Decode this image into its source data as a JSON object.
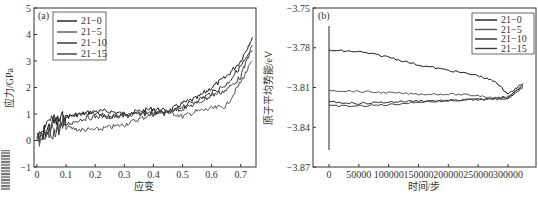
{
  "chart_data": [
    {
      "panel": "(a)",
      "type": "line",
      "title": "",
      "xlabel": "应变",
      "ylabel": "应力/GPa",
      "xlim": [
        -0.01,
        0.75
      ],
      "ylim": [
        -1,
        5
      ],
      "xticks": [
        "0",
        "0.1",
        "0.2",
        "0.3",
        "0.4",
        "0.5",
        "0.6",
        "0.7"
      ],
      "yticks": [
        "-1",
        "0",
        "1",
        "2",
        "3",
        "4",
        "5"
      ],
      "grid": false,
      "legend_position": "upper left",
      "series": [
        {
          "name": "21-0",
          "x": [
            0,
            0.05,
            0.1,
            0.15,
            0.2,
            0.25,
            0.3,
            0.35,
            0.4,
            0.45,
            0.5,
            0.55,
            0.6,
            0.65,
            0.7,
            0.74
          ],
          "y": [
            0.0,
            0.6,
            0.9,
            1.0,
            1.1,
            1.1,
            1.0,
            1.1,
            1.2,
            1.1,
            1.4,
            1.6,
            2.0,
            2.4,
            3.0,
            3.9
          ]
        },
        {
          "name": "21-5",
          "x": [
            0,
            0.05,
            0.1,
            0.15,
            0.2,
            0.25,
            0.3,
            0.35,
            0.4,
            0.45,
            0.5,
            0.55,
            0.6,
            0.65,
            0.7,
            0.74
          ],
          "y": [
            0.0,
            0.4,
            0.5,
            0.4,
            0.4,
            0.5,
            0.6,
            0.8,
            1.0,
            1.1,
            0.9,
            1.1,
            1.2,
            1.3,
            2.2,
            3.0
          ]
        },
        {
          "name": "21-10",
          "x": [
            0,
            0.05,
            0.1,
            0.15,
            0.2,
            0.25,
            0.3,
            0.35,
            0.4,
            0.45,
            0.5,
            0.55,
            0.6,
            0.65,
            0.7,
            0.74
          ],
          "y": [
            0.0,
            0.7,
            0.9,
            1.0,
            1.0,
            0.9,
            1.0,
            1.0,
            1.1,
            1.0,
            1.3,
            1.5,
            1.8,
            2.1,
            2.8,
            3.4
          ]
        },
        {
          "name": "21-15",
          "x": [
            0,
            0.05,
            0.1,
            0.15,
            0.2,
            0.25,
            0.3,
            0.35,
            0.4,
            0.45,
            0.5,
            0.55,
            0.6,
            0.65,
            0.7,
            0.74
          ],
          "y": [
            0.0,
            0.3,
            0.6,
            0.8,
            0.9,
            0.9,
            0.9,
            1.0,
            1.0,
            1.1,
            1.2,
            1.4,
            1.7,
            1.9,
            2.4,
            3.6
          ]
        }
      ]
    },
    {
      "panel": "(b)",
      "type": "line",
      "title": "",
      "xlabel": "时间/步",
      "ylabel": "原子平均势能/eV",
      "xlim": [
        -25000,
        330000
      ],
      "ylim": [
        -3.87,
        -3.75
      ],
      "xticks": [
        "0",
        "50000",
        "100000",
        "150000",
        "200000",
        "250000",
        "300000"
      ],
      "yticks": [
        "-3.75",
        "-3.78",
        "-3.81",
        "-3.84",
        "-3.87"
      ],
      "grid": false,
      "legend_position": "upper right",
      "series": [
        {
          "name": "21-0",
          "x": [
            0,
            50000,
            100000,
            150000,
            200000,
            250000,
            280000,
            300000,
            325000
          ],
          "y": [
            -3.782,
            -3.783,
            -3.787,
            -3.793,
            -3.797,
            -3.801,
            -3.806,
            -3.815,
            -3.807
          ]
        },
        {
          "name": "21-5",
          "x": [
            0,
            50000,
            100000,
            150000,
            200000,
            250000,
            280000,
            300000,
            325000
          ],
          "y": [
            -3.812,
            -3.813,
            -3.814,
            -3.815,
            -3.815,
            -3.816,
            -3.818,
            -3.818,
            -3.808
          ]
        },
        {
          "name": "21-10",
          "x": [
            0,
            50000,
            100000,
            150000,
            200000,
            250000,
            280000,
            300000,
            325000
          ],
          "y": [
            -3.821,
            -3.822,
            -3.821,
            -3.82,
            -3.82,
            -3.819,
            -3.819,
            -3.818,
            -3.81
          ]
        },
        {
          "name": "21-15",
          "x": [
            0,
            50000,
            100000,
            150000,
            200000,
            250000,
            280000,
            300000,
            325000
          ],
          "y": [
            -3.824,
            -3.824,
            -3.823,
            -3.821,
            -3.82,
            -3.819,
            -3.818,
            -3.817,
            -3.809
          ]
        }
      ]
    }
  ],
  "panels": {
    "a": {
      "tag": "(a)",
      "xlabel": "应变",
      "ylabel": "应力/GPa",
      "legend": [
        "21-0",
        "21-5",
        "21-10",
        "21-15"
      ]
    },
    "b": {
      "tag": "(b)",
      "xlabel": "时间/步",
      "ylabel": "原子平均势能/eV",
      "legend": [
        "21-0",
        "21-5",
        "21-10",
        "21-15"
      ]
    }
  },
  "colors": {
    "axis": "#333333",
    "series": [
      "#1a1a1a",
      "#555555",
      "#2e2e2e",
      "#3d3d3d"
    ]
  }
}
